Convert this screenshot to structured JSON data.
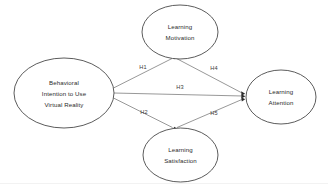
{
  "diagram": {
    "background_color": "#ffffff",
    "node_stroke_color": "#4a4a4a",
    "edge_stroke_color": "#7d7d7d",
    "arrow_color": "#2b2b2b",
    "text_color": "#2b2b2b",
    "nodes": [
      {
        "id": "behavioral-intention",
        "shape": "ellipse",
        "cx": 64,
        "cy": 93,
        "rx": 50,
        "ry": 35,
        "lines": [
          "Behavioral",
          "Intention to Use",
          "Virtual Reality"
        ]
      },
      {
        "id": "learning-motivation",
        "shape": "ellipse",
        "cx": 180,
        "cy": 32,
        "rx": 38,
        "ry": 27,
        "lines": [
          "Learning",
          "Motivation"
        ]
      },
      {
        "id": "learning-satisfaction",
        "shape": "ellipse",
        "cx": 180.5,
        "cy": 155,
        "rx": 37.5,
        "ry": 27,
        "lines": [
          "Learning",
          "Satisfaction"
        ]
      },
      {
        "id": "learning-attention",
        "shape": "ellipse",
        "cx": 281,
        "cy": 97,
        "rx": 35,
        "ry": 27,
        "lines": [
          "Learning",
          "Attention"
        ]
      }
    ],
    "edges": [
      {
        "id": "h1",
        "label": "H1",
        "from": "behavioral-intention",
        "to": "learning-motivation",
        "x1": 113.5,
        "y1": 88,
        "x2": 172,
        "y2": 58,
        "label_x": 143,
        "label_y": 68.5
      },
      {
        "id": "h4",
        "label": "H4",
        "from": "learning-motivation",
        "to": "learning-attention",
        "x1": 176,
        "y1": 58.5,
        "x2": 244,
        "y2": 93.5,
        "label_x": 214,
        "label_y": 70
      },
      {
        "id": "h3",
        "label": "H3",
        "from": "behavioral-intention",
        "to": "learning-attention",
        "x1": 113.5,
        "y1": 93,
        "x2": 244,
        "y2": 96,
        "label_x": 180,
        "label_y": 89
      },
      {
        "id": "h2",
        "label": "H2",
        "from": "behavioral-intention",
        "to": "learning-satisfaction",
        "x1": 113.5,
        "y1": 98,
        "x2": 172.5,
        "y2": 128,
        "label_x": 144,
        "label_y": 114
      },
      {
        "id": "h5",
        "label": "H5",
        "from": "learning-satisfaction",
        "to": "learning-attention",
        "x1": 177,
        "y1": 128,
        "x2": 244,
        "y2": 99,
        "label_x": 214,
        "label_y": 115
      }
    ]
  }
}
